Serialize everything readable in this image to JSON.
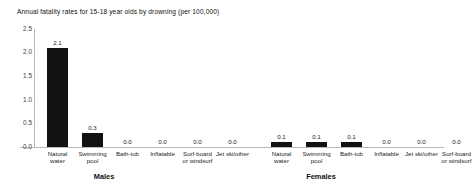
{
  "chart_data": {
    "type": "bar",
    "title": "Annual fatality rates for 15-18 year olds by drowning (per 100,000)",
    "xlabel": "",
    "ylabel": "",
    "ylim": [
      0.0,
      2.5
    ],
    "yticks": [
      "0.0",
      "0.5",
      "1.0",
      "1.5",
      "2.0",
      "2.5"
    ],
    "ytick_values": [
      0.0,
      0.5,
      1.0,
      1.5,
      2.0,
      2.5
    ],
    "grid": false,
    "legend": "none",
    "bar_color": "#111111",
    "axis_color": "#b9b9b9",
    "groups": [
      {
        "name": "Males",
        "label": "Males",
        "categories": [
          "Natural water",
          "Swimming pool",
          "Bath-tub",
          "Inflatable",
          "Surf-board or windsurf",
          "Jet ski/other"
        ],
        "values": [
          2.1,
          0.3,
          0.0,
          0.0,
          0.0,
          0.0
        ],
        "value_labels": [
          "2.1",
          "0.3",
          "0.0",
          "0.0",
          "0.0",
          "0.0"
        ]
      },
      {
        "name": "Females",
        "label": "Females",
        "categories": [
          "Natural water",
          "Swimming pool",
          "Bath-tub",
          "Inflatable",
          "Jet ski/other",
          "Surf-board or windsurf"
        ],
        "values": [
          0.1,
          0.1,
          0.1,
          0.0,
          0.0,
          0.0
        ],
        "value_labels": [
          "0.1",
          "0.1",
          "0.1",
          "0.0",
          "0.0",
          "0.0"
        ]
      }
    ]
  },
  "layout": {
    "plot_left": 34,
    "plot_top": 29,
    "plot_height": 118,
    "baseline_y": 147,
    "bar_width": 21,
    "bar_slot": 35,
    "group_gap": 14,
    "males_group_label_x": 104,
    "females_group_label_x": 321,
    "group_label_y": 172
  }
}
